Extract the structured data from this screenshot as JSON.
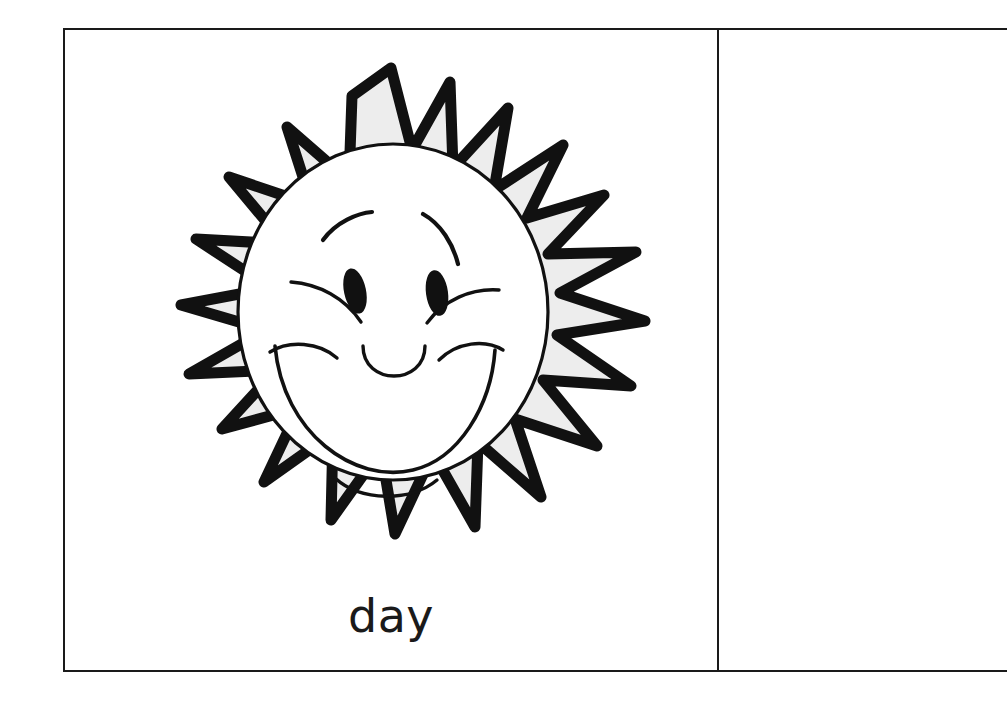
{
  "worksheet": {
    "kind": "flashcard-worksheet",
    "background_color": "#ffffff",
    "line_color": "#1a1a1a"
  },
  "cells": [
    {
      "id": "left",
      "caption": "day",
      "illustration": {
        "name": "smiling-sun",
        "semantic": "sun-icon",
        "ray_count": 18,
        "ray_fill_color": "#ededed",
        "face_fill_color": "#ffffff",
        "outline_color": "#111111",
        "features": [
          "eyebrow-left",
          "eyebrow-right",
          "eye-left",
          "eye-right",
          "cheek-line-left",
          "cheek-line-right",
          "nose",
          "smile-mouth",
          "chin-line"
        ]
      }
    },
    {
      "id": "right",
      "caption": "",
      "illustration": null
    }
  ],
  "caption_left": "day",
  "caption_right": ""
}
